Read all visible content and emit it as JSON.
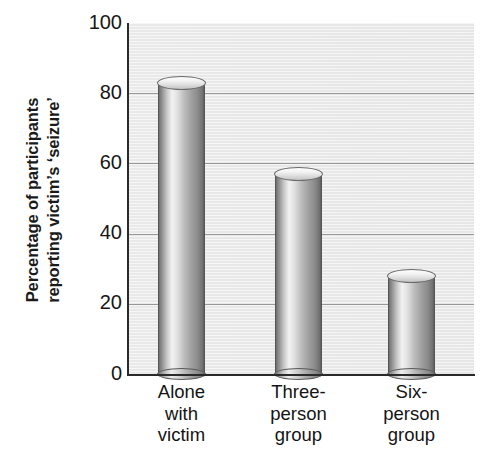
{
  "chart_data": {
    "type": "bar",
    "title": "",
    "subtitle": "",
    "xlabel": "",
    "ylabel": "Percentage of participants reporting victim's 'seizure'",
    "ylabel_lines": [
      "Percentage of participants",
      "reporting victim’s ‘seizure’"
    ],
    "categories": [
      "Alone with victim",
      "Three-person group",
      "Six-person group"
    ],
    "category_label_lines": [
      [
        "Alone",
        "with",
        "victim"
      ],
      [
        "Three-",
        "person",
        "group"
      ],
      [
        "Six-",
        "person",
        "group"
      ]
    ],
    "values": [
      85,
      59,
      30
    ],
    "ylim": [
      0,
      100
    ],
    "yticks": [
      0,
      20,
      40,
      60,
      80,
      100
    ],
    "ytick_labels": [
      "0",
      "20",
      "40",
      "60",
      "80",
      "100"
    ],
    "grid": true,
    "grid_axis": "y",
    "legend": null,
    "legend_position": "none",
    "bar_style": "cylinder-3d",
    "colors": {
      "plot_background": "#eaeaea",
      "figure_background": "#ffffff",
      "gridline": "#888888",
      "axis": "#2a2a2a",
      "bar_light": "#f2f2f2",
      "bar_dark": "#5e5e5e",
      "text": "#141414"
    }
  },
  "axes": {
    "y_title_line1": "Percentage of participants",
    "y_title_line2": "reporting victim’s ‘seizure’",
    "ticks": [
      {
        "label": "100",
        "value": 100
      },
      {
        "label": "80",
        "value": 80
      },
      {
        "label": "60",
        "value": 60
      },
      {
        "label": "40",
        "value": 40
      },
      {
        "label": "20",
        "value": 20
      },
      {
        "label": "0",
        "value": 0
      }
    ]
  },
  "bars": [
    {
      "name": "alone-with-victim",
      "value": 85,
      "label_lines": {
        "l1": "Alone",
        "l2": "with",
        "l3": "victim"
      }
    },
    {
      "name": "three-person-group",
      "value": 59,
      "label_lines": {
        "l1": "Three-",
        "l2": "person",
        "l3": "group"
      }
    },
    {
      "name": "six-person-group",
      "value": 30,
      "label_lines": {
        "l1": "Six-",
        "l2": "person",
        "l3": "group"
      }
    }
  ]
}
